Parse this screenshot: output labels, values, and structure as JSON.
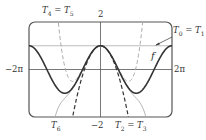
{
  "chart_data": {
    "type": "line",
    "title": "",
    "xlabel": "",
    "ylabel": "",
    "xlim": [
      -6.2832,
      6.2832
    ],
    "ylim": [
      -2,
      2
    ],
    "grid": false,
    "tick_labels": {
      "x_left": "−2π",
      "x_right": "2π",
      "y_top": "2",
      "y_bottom": "−2"
    },
    "series": [
      {
        "name": "f",
        "label": "f",
        "formula": "cos(x)",
        "style": "solid",
        "color": "#333333",
        "width": 1.6
      },
      {
        "name": "T0 = T1",
        "label": "T0 = T1",
        "formula": "1",
        "style": "solid",
        "color": "#bdbdbd",
        "width": 1.2
      },
      {
        "name": "T2 = T3",
        "label": "T2 = T3",
        "formula": "1 - x^2/2",
        "style": "dashed",
        "color": "#333333",
        "width": 1.2
      },
      {
        "name": "T4 = T5",
        "label": "T4 = T5",
        "formula": "1 - x^2/2 + x^4/24",
        "style": "dashed",
        "color": "#aaaaaa",
        "width": 1.0
      },
      {
        "name": "T6",
        "label": "T6",
        "formula": "1 - x^2/2 + x^4/24 - x^6/720",
        "style": "solid",
        "color": "#aaaaaa",
        "width": 1.0
      }
    ],
    "annotations": [
      {
        "text": "T4 = T5",
        "position": "top-left"
      },
      {
        "text": "T0 = T1",
        "position": "right, arrow to horizontal line y=1"
      },
      {
        "text": "f",
        "position": "right, near cos curve"
      },
      {
        "text": "T6",
        "position": "bottom-left"
      },
      {
        "text": "T2 = T3",
        "position": "bottom-center-right"
      }
    ]
  },
  "labels": {
    "t4t5": {
      "base1": "T",
      "sub1": "4",
      "eq": " = ",
      "base2": "T",
      "sub2": "5"
    },
    "t0t1": {
      "base1": "T",
      "sub1": "0",
      "eq": " = ",
      "base2": "T",
      "sub2": "1"
    },
    "t2t3": {
      "base1": "T",
      "sub1": "2",
      "eq": " = ",
      "base2": "T",
      "sub2": "3"
    },
    "t6": {
      "base1": "T",
      "sub1": "6"
    },
    "f": "f",
    "y_top": "2",
    "y_bottom": "−2",
    "x_left": "−2π",
    "x_right": "2π"
  }
}
